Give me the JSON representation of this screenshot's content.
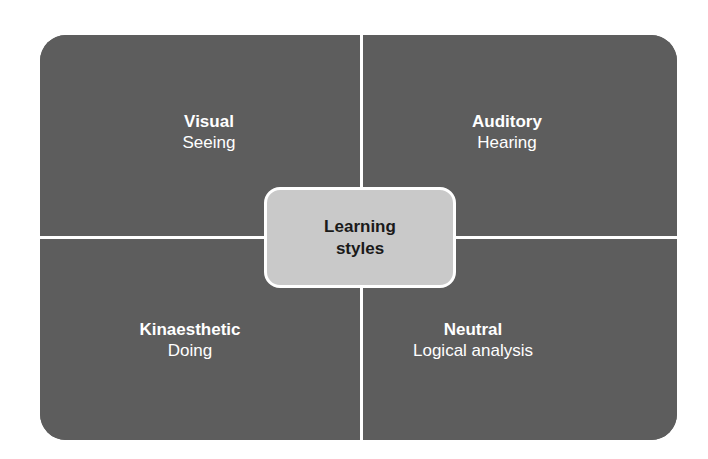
{
  "center": {
    "line1": "Learning",
    "line2": "styles"
  },
  "quadrants": [
    {
      "title": "Visual",
      "subtitle": "Seeing"
    },
    {
      "title": "Auditory",
      "subtitle": "Hearing"
    },
    {
      "title": "Kinaesthetic",
      "subtitle": "Doing"
    },
    {
      "title": "Neutral",
      "subtitle": "Logical analysis"
    }
  ],
  "colors": {
    "panel": "#5d5d5d",
    "center": "#c9c9c9",
    "divider": "#ffffff"
  }
}
